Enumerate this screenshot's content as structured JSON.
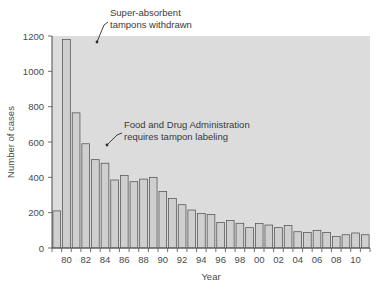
{
  "chart_data": {
    "type": "bar",
    "title": "",
    "xlabel": "Year",
    "ylabel": "Number of cases",
    "ylim": [
      0,
      1200
    ],
    "yticks": [
      0,
      200,
      400,
      600,
      800,
      1000,
      1200
    ],
    "ytick_labels": [
      "0",
      "200",
      "400",
      "600",
      "800",
      "1000",
      "1200"
    ],
    "grid": false,
    "legend": null,
    "categories": [
      "1979",
      "1980",
      "1981",
      "1982",
      "1983",
      "1984",
      "1985",
      "1986",
      "1987",
      "1988",
      "1989",
      "1990",
      "1991",
      "1992",
      "1993",
      "1994",
      "1995",
      "1996",
      "1997",
      "1998",
      "1999",
      "2000",
      "2001",
      "2002",
      "2003",
      "2004",
      "2005",
      "2006",
      "2007",
      "2008",
      "2009",
      "2010",
      "2011"
    ],
    "xtick_labels": [
      "80",
      "82",
      "84",
      "86",
      "88",
      "90",
      "92",
      "94",
      "96",
      "98",
      "00",
      "02",
      "04",
      "06",
      "08",
      "10"
    ],
    "xtick_categories": [
      "1980",
      "1982",
      "1984",
      "1986",
      "1988",
      "1990",
      "1992",
      "1994",
      "1996",
      "1998",
      "2000",
      "2002",
      "2004",
      "2006",
      "2008",
      "2010"
    ],
    "values": [
      210,
      1180,
      765,
      590,
      500,
      480,
      385,
      410,
      375,
      390,
      400,
      320,
      280,
      245,
      215,
      195,
      190,
      145,
      155,
      140,
      115,
      138,
      130,
      115,
      128,
      92,
      87,
      100,
      88,
      65,
      75,
      85,
      75
    ],
    "annotations": [
      {
        "id": "super-absorbent",
        "lines": [
          "Super-absorbent",
          "tampons withdrawn"
        ],
        "target_category": "1980",
        "target_value": 1180
      },
      {
        "id": "fda-labeling",
        "lines": [
          "Food and Drug Administration",
          "requires tampon labeling"
        ],
        "target_category": "1982",
        "target_value": 590
      }
    ],
    "colors": {
      "plot_background": "#dcdcdc",
      "bar_fill": "#cfcfcf",
      "bar_stroke": "#4a4a4a",
      "axis": "#4a4a4a",
      "text": "#3a3a3a",
      "page_background": "#ffffff"
    }
  }
}
